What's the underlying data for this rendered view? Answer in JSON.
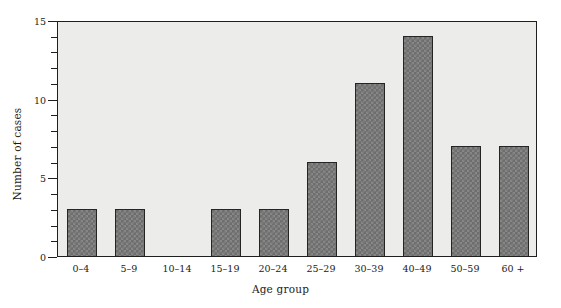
{
  "chart_data": {
    "type": "bar",
    "title": "",
    "xlabel": "Age group",
    "ylabel": "Number of cases",
    "categories": [
      "0–4",
      "5–9",
      "10–14",
      "15–19",
      "20–24",
      "25–29",
      "30–39",
      "40–49",
      "50–59",
      "60 +"
    ],
    "values": [
      3,
      3,
      0,
      3,
      3,
      6,
      11,
      14,
      7,
      7
    ],
    "ylim": [
      0,
      15
    ],
    "y_major_ticks": [
      0,
      5,
      10,
      15
    ],
    "y_major_tick_labels": [
      "0",
      "5",
      "10",
      "15"
    ],
    "y_minor_ticks": [
      1,
      2,
      3,
      4,
      6,
      7,
      8,
      9,
      11,
      12,
      13,
      14
    ],
    "grid": false,
    "legend": null,
    "bar_fill_color": "#6e6e6e",
    "bar_edge_color": "#252525",
    "plot_background_color": "#ececeb",
    "figure_background_color": "#ffffff",
    "axis_color": "#1f1f1f"
  }
}
